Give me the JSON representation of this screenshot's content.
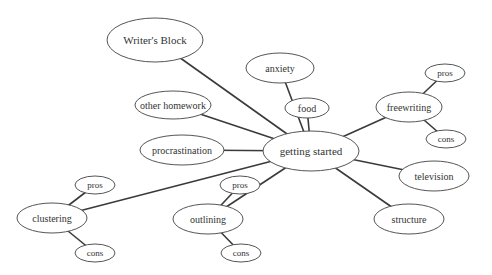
{
  "diagram": {
    "type": "mind-map",
    "center": "getting started",
    "nodes": [
      {
        "id": "getting-started",
        "label": "getting started",
        "cx": 311,
        "cy": 151,
        "rx": 48,
        "ry": 20,
        "fs": 11
      },
      {
        "id": "writers-block",
        "label": "Writer's Block",
        "cx": 155,
        "cy": 40,
        "rx": 48,
        "ry": 22,
        "fs": 11
      },
      {
        "id": "anxiety",
        "label": "anxiety",
        "cx": 280,
        "cy": 68,
        "rx": 34,
        "ry": 15,
        "fs": 10
      },
      {
        "id": "other-homework",
        "label": "other homework",
        "cx": 173,
        "cy": 105,
        "rx": 38,
        "ry": 14,
        "fs": 10
      },
      {
        "id": "food",
        "label": "food",
        "cx": 307,
        "cy": 108,
        "rx": 22,
        "ry": 10,
        "fs": 10
      },
      {
        "id": "freewriting",
        "label": "freewriting",
        "cx": 409,
        "cy": 107,
        "rx": 33,
        "ry": 15,
        "fs": 10
      },
      {
        "id": "freewriting-pros",
        "label": "pros",
        "cx": 445,
        "cy": 73,
        "rx": 20,
        "ry": 9,
        "fs": 9
      },
      {
        "id": "freewriting-cons",
        "label": "cons",
        "cx": 446,
        "cy": 139,
        "rx": 20,
        "ry": 9,
        "fs": 9
      },
      {
        "id": "procrastination",
        "label": "procrastination",
        "cx": 182,
        "cy": 150,
        "rx": 42,
        "ry": 15,
        "fs": 10
      },
      {
        "id": "television",
        "label": "television",
        "cx": 434,
        "cy": 176,
        "rx": 35,
        "ry": 15,
        "fs": 10
      },
      {
        "id": "structure",
        "label": "structure",
        "cx": 409,
        "cy": 219,
        "rx": 35,
        "ry": 15,
        "fs": 10
      },
      {
        "id": "clustering",
        "label": "clustering",
        "cx": 52,
        "cy": 218,
        "rx": 35,
        "ry": 15,
        "fs": 10
      },
      {
        "id": "clustering-pros",
        "label": "pros",
        "cx": 95,
        "cy": 185,
        "rx": 20,
        "ry": 9,
        "fs": 9
      },
      {
        "id": "clustering-cons",
        "label": "cons",
        "cx": 95,
        "cy": 253,
        "rx": 20,
        "ry": 9,
        "fs": 9
      },
      {
        "id": "outlining",
        "label": "outlining",
        "cx": 208,
        "cy": 219,
        "rx": 35,
        "ry": 15,
        "fs": 10
      },
      {
        "id": "outlining-pros",
        "label": "pros",
        "cx": 240,
        "cy": 185,
        "rx": 20,
        "ry": 9,
        "fs": 9
      },
      {
        "id": "outlining-cons",
        "label": "cons",
        "cx": 241,
        "cy": 253,
        "rx": 20,
        "ry": 9,
        "fs": 9
      }
    ],
    "edges": [
      [
        "getting-started",
        "writers-block"
      ],
      [
        "getting-started",
        "anxiety"
      ],
      [
        "getting-started",
        "other-homework"
      ],
      [
        "getting-started",
        "food"
      ],
      [
        "getting-started",
        "freewriting"
      ],
      [
        "getting-started",
        "procrastination"
      ],
      [
        "getting-started",
        "television"
      ],
      [
        "getting-started",
        "structure"
      ],
      [
        "getting-started",
        "clustering"
      ],
      [
        "getting-started",
        "outlining"
      ],
      [
        "freewriting",
        "freewriting-pros"
      ],
      [
        "freewriting",
        "freewriting-cons"
      ],
      [
        "clustering",
        "clustering-pros"
      ],
      [
        "clustering",
        "clustering-cons"
      ],
      [
        "outlining",
        "outlining-pros"
      ],
      [
        "outlining",
        "outlining-cons"
      ]
    ]
  }
}
